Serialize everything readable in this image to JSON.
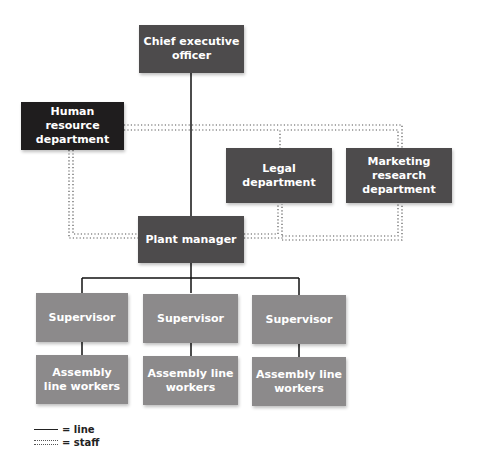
{
  "nodes": {
    "ceo": "Chief executive officer",
    "hr": "Human resource department",
    "legal": "Legal department",
    "marketing": "Marketing research department",
    "plant_manager": "Plant manager",
    "supervisors": [
      "Supervisor",
      "Supervisor",
      "Supervisor"
    ],
    "workers": [
      "Assembly line workers",
      "Assembly line workers",
      "Assembly line workers"
    ]
  },
  "legend": {
    "line_label": "= line",
    "staff_label": "= staff"
  },
  "colors": {
    "executive": "#4d4b4c",
    "staff_hr": "#1f1d1e",
    "staff_other": "#4d4b4c",
    "lower": "#8c8a8b"
  }
}
